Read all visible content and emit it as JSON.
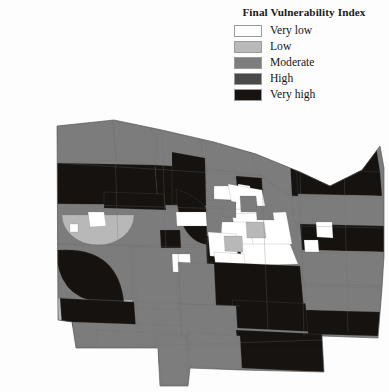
{
  "figure": {
    "kind": "choropleth-map",
    "background": "#fdfdfd"
  },
  "legend": {
    "title": "Final Vulnerability Index",
    "position": "top-right",
    "items": [
      {
        "label": "Very low",
        "color": "#ffffff"
      },
      {
        "label": "Low",
        "color": "#b9b9b9"
      },
      {
        "label": "Moderate",
        "color": "#7d7d7d"
      },
      {
        "label": "High",
        "color": "#4a4a4a"
      },
      {
        "label": "Very high",
        "color": "#161310"
      }
    ]
  },
  "chart_data": {
    "type": "map",
    "title": "Final Vulnerability Index",
    "xlabel": "",
    "ylabel": "",
    "grid": false,
    "legend_position": "top-right",
    "classification": "5-class ordinal (very low to very high)",
    "palette": [
      "#ffffff",
      "#b9b9b9",
      "#7d7d7d",
      "#4a4a4a",
      "#161310"
    ],
    "categories": [
      "Very low",
      "Low",
      "Moderate",
      "High",
      "Very high"
    ],
    "outline_color": "#6e6e6e",
    "regions": [
      {
        "id": "nw-lakefront-1",
        "class": "Moderate",
        "color": "#7d7d7d",
        "d": "M57,126 L112,121 L117,160 L60,163 Z"
      },
      {
        "id": "nw-lakefront-2",
        "class": "Moderate",
        "color": "#7d7d7d",
        "d": "M112,121 L150,128 L158,140 L155,165 L117,160 Z"
      },
      {
        "id": "nw-lakefront-3",
        "class": "Moderate",
        "color": "#7d7d7d",
        "d": "M150,128 L200,140 L205,168 L155,165 L158,140 Z"
      },
      {
        "id": "nw-lakefront-4",
        "class": "Moderate",
        "color": "#7d7d7d",
        "d": "M200,140 L250,152 L262,176 L205,168 Z"
      },
      {
        "id": "w-darkband-1",
        "class": "Very high",
        "color": "#161310",
        "d": "M57,163 L155,165 L158,205 L57,204 Z"
      },
      {
        "id": "w-darkband-2",
        "class": "Very high",
        "color": "#161310",
        "d": "M155,165 L205,168 L206,206 L158,205 Z"
      },
      {
        "id": "w-moderate-lower",
        "class": "Moderate",
        "color": "#7d7d7d",
        "d": "M57,204 L206,206 L208,245 L57,244 Z"
      },
      {
        "id": "w-low-circle",
        "class": "Low",
        "color": "#b9b9b9",
        "d": "M62,215 a36,30 0 0 0 72,0 z"
      },
      {
        "id": "w-verylow-patch-a",
        "class": "Very low",
        "color": "#ffffff",
        "d": "M88,212 L104,212 L106,226 L90,227 Z"
      },
      {
        "id": "w-verylow-patch-b",
        "class": "Very low",
        "color": "#ffffff",
        "d": "M70,224 L78,224 L78,232 L70,232 Z"
      },
      {
        "id": "w-lower-mod",
        "class": "Moderate",
        "color": "#7d7d7d",
        "d": "M57,244 L130,246 L132,300 L58,298 Z"
      },
      {
        "id": "w-strip-low",
        "class": "Low",
        "color": "#b9b9b9",
        "d": "M57,298 L132,300 L134,330 L59,328 Z"
      },
      {
        "id": "nw-col-mod",
        "class": "Moderate",
        "color": "#7d7d7d",
        "d": "M132,246 L175,248 L178,310 L134,308 Z"
      },
      {
        "id": "nc-dark-block",
        "class": "Very high",
        "color": "#161310",
        "d": "M172,152 L205,158 L206,206 L172,204 Z"
      },
      {
        "id": "nc-dark-arc",
        "class": "Very high",
        "color": "#161310",
        "d": "M178,190 q38,10 40,55 q-40,4 -42,-56 Z"
      },
      {
        "id": "nc-mod-1",
        "class": "Moderate",
        "color": "#7d7d7d",
        "d": "M206,170 L236,172 L240,200 L206,200 Z"
      },
      {
        "id": "nc-verylow-1",
        "class": "Very low",
        "color": "#ffffff",
        "d": "M214,186 L232,186 L233,200 L214,199 Z"
      },
      {
        "id": "nc-dark-2",
        "class": "Very high",
        "color": "#161310",
        "d": "M236,176 L262,178 L264,206 L238,205 Z"
      },
      {
        "id": "nc-mod-2",
        "class": "Moderate",
        "color": "#7d7d7d",
        "d": "M240,200 L272,202 L274,232 L240,230 Z"
      },
      {
        "id": "nc-mod-3",
        "class": "Moderate",
        "color": "#7d7d7d",
        "d": "M206,206 L240,208 L242,238 L207,236 Z"
      },
      {
        "id": "nc-dark-3",
        "class": "Very high",
        "color": "#161310",
        "d": "M206,238 L245,240 L246,268 L207,266 Z"
      },
      {
        "id": "nc-verylow-2",
        "class": "Very low",
        "color": "#ffffff",
        "d": "M176,212 L206,212 L207,226 L177,226 Z"
      },
      {
        "id": "nc-dark-4",
        "class": "Very high",
        "color": "#161310",
        "d": "M104,192 L164,194 L166,210 L104,208 Z"
      },
      {
        "id": "nc-dark-5",
        "class": "Very high",
        "color": "#161310",
        "d": "M160,230 L180,230 L181,248 L161,248 Z"
      },
      {
        "id": "nc-verylow-3",
        "class": "Very low",
        "color": "#ffffff",
        "d": "M172,254 L190,254 L191,272 L173,272 Z"
      },
      {
        "id": "lake-edge-mod",
        "class": "Moderate",
        "color": "#7d7d7d",
        "d": "M250,152 L300,172 L320,192 L300,202 L262,178 Z"
      },
      {
        "id": "coast-mod-1",
        "class": "Moderate",
        "color": "#7d7d7d",
        "d": "M262,178 L300,202 L296,236 L266,232 Z"
      },
      {
        "id": "core-verylow-1",
        "class": "Very low",
        "color": "#ffffff",
        "d": "M238,184 L250,186 L251,198 L239,197 Z"
      },
      {
        "id": "urban-core-1",
        "class": "Very low",
        "color": "#ffffff",
        "d": "M228,184 L262,190 L268,222 L236,226 Z"
      },
      {
        "id": "urban-core-2",
        "class": "Very low",
        "color": "#ffffff",
        "d": "M232,214 L286,212 L292,244 L238,248 Z"
      },
      {
        "id": "urban-core-3",
        "class": "Very low",
        "color": "#ffffff",
        "d": "M222,222 L250,222 L254,252 L220,250 Z"
      },
      {
        "id": "urban-core-4",
        "class": "Very low",
        "color": "#ffffff",
        "d": "M208,232 L236,234 L238,258 L210,256 Z"
      },
      {
        "id": "urban-core-5",
        "class": "Very low",
        "color": "#ffffff",
        "d": "M240,244 L290,244 L298,264 L242,266 Z"
      },
      {
        "id": "urban-core-6",
        "class": "Very low",
        "color": "#ffffff",
        "d": "M214,252 L244,254 L246,272 L216,270 Z"
      },
      {
        "id": "core-grey-1",
        "class": "Moderate",
        "color": "#7d7d7d",
        "d": "M240,196 L256,196 L258,212 L241,212 Z"
      },
      {
        "id": "core-grey-2",
        "class": "Moderate",
        "color": "#7d7d7d",
        "d": "M222,200 L236,202 L236,218 L222,216 Z"
      },
      {
        "id": "core-grey-3",
        "class": "Low",
        "color": "#b9b9b9",
        "d": "M246,222 L264,222 L266,238 L247,238 Z"
      },
      {
        "id": "core-grey-4",
        "class": "Low",
        "color": "#b9b9b9",
        "d": "M224,236 L242,236 L243,252 L225,251 Z"
      },
      {
        "id": "core-grey-5",
        "class": "Moderate",
        "color": "#7d7d7d",
        "d": "M256,206 L272,206 L274,220 L257,220 Z"
      },
      {
        "id": "ne-dark-1",
        "class": "Very high",
        "color": "#161310",
        "d": "M300,128 L372,120 L380,172 L306,176 Z"
      },
      {
        "id": "ne-dark-2",
        "class": "Very high",
        "color": "#161310",
        "d": "M290,160 L344,164 L348,200 L292,196 Z"
      },
      {
        "id": "ne-mod-1",
        "class": "Moderate",
        "color": "#7d7d7d",
        "d": "M294,148 L320,150 L322,168 L296,166 Z"
      },
      {
        "id": "ne-low-1",
        "class": "Low",
        "color": "#b9b9b9",
        "d": "M304,148 L320,150 L321,162 L305,161 Z"
      },
      {
        "id": "ne-mod-2",
        "class": "Moderate",
        "color": "#7d7d7d",
        "d": "M344,146 L364,146 L366,164 L345,164 Z"
      },
      {
        "id": "ne-mod-3",
        "class": "Moderate",
        "color": "#7d7d7d",
        "d": "M292,196 L348,200 L350,226 L294,222 Z"
      },
      {
        "id": "e-dark-band",
        "class": "Very high",
        "color": "#161310",
        "d": "M296,168 L380,172 L382,196 L298,194 Z"
      },
      {
        "id": "e-mod-1",
        "class": "Moderate",
        "color": "#7d7d7d",
        "d": "M298,194 L382,196 L384,226 L300,224 Z"
      },
      {
        "id": "e-dark-2",
        "class": "Very high",
        "color": "#161310",
        "d": "M300,224 L384,226 L384,252 L302,250 Z"
      },
      {
        "id": "e-mod-2",
        "class": "Moderate",
        "color": "#7d7d7d",
        "d": "M302,250 L384,252 L382,286 L304,284 Z"
      },
      {
        "id": "e-verylow-1",
        "class": "Very low",
        "color": "#ffffff",
        "d": "M316,222 L332,222 L333,238 L317,237 Z"
      },
      {
        "id": "e-verylow-2",
        "class": "Very low",
        "color": "#ffffff",
        "d": "M304,240 L318,240 L319,252 L305,252 Z"
      },
      {
        "id": "sc-dark-1",
        "class": "Very high",
        "color": "#161310",
        "d": "M210,262 L300,266 L304,310 L214,306 Z"
      },
      {
        "id": "sc-dark-2",
        "class": "Very high",
        "color": "#161310",
        "d": "M232,300 L316,304 L318,332 L236,328 Z"
      },
      {
        "id": "sc-mod-1",
        "class": "Moderate",
        "color": "#7d7d7d",
        "d": "M178,262 L214,264 L216,306 L180,304 Z"
      },
      {
        "id": "sc-mod-2",
        "class": "Moderate",
        "color": "#7d7d7d",
        "d": "M180,304 L236,306 L238,340 L182,338 Z"
      },
      {
        "id": "sw-dark-1",
        "class": "Very high",
        "color": "#161310",
        "d": "M58,250 q60,-4 66,52 q-66,8 -68,-52 Z"
      },
      {
        "id": "sw-dark-2",
        "class": "Very high",
        "color": "#161310",
        "d": "M60,298 L134,302 L136,330 L62,326 Z"
      },
      {
        "id": "sw-mod-1",
        "class": "Moderate",
        "color": "#7d7d7d",
        "d": "M72,322 L186,326 L188,350 L76,346 Z"
      },
      {
        "id": "s-mod-2",
        "class": "Moderate",
        "color": "#7d7d7d",
        "d": "M96,330 L184,334 L186,372 L100,368 Z"
      },
      {
        "id": "s-verylow-1",
        "class": "Very low",
        "color": "#ffffff",
        "d": "M176,340 L182,340 L183,350 L177,350 Z"
      },
      {
        "id": "s-peninsula",
        "class": "Moderate",
        "color": "#7d7d7d",
        "d": "M156,336 L186,336 L188,384 L162,384 L160,364 L156,356 Z"
      },
      {
        "id": "s-dark-3",
        "class": "Very high",
        "color": "#161310",
        "d": "M236,330 L322,334 L324,372 L240,368 Z"
      },
      {
        "id": "s-mod-3",
        "class": "Moderate",
        "color": "#7d7d7d",
        "d": "M188,332 L240,336 L242,370 L190,366 Z"
      },
      {
        "id": "se-mod-1",
        "class": "Moderate",
        "color": "#7d7d7d",
        "d": "M304,284 L382,286 L380,312 L306,310 Z"
      },
      {
        "id": "se-dark-1",
        "class": "Very high",
        "color": "#161310",
        "d": "M306,310 L380,312 L378,336 L308,334 Z"
      }
    ]
  }
}
